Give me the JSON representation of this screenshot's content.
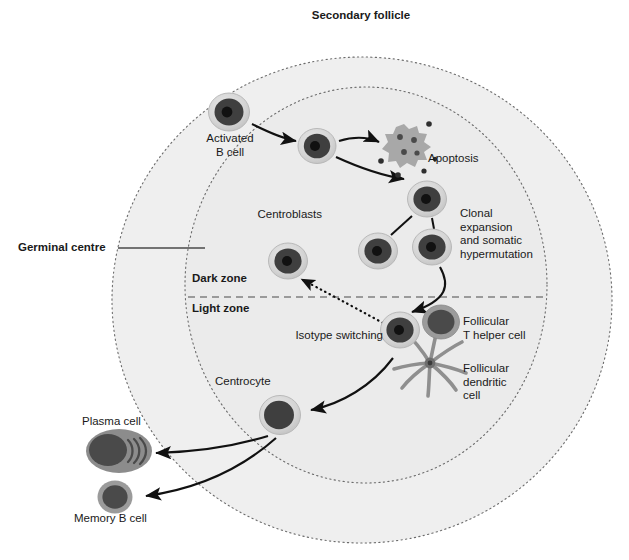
{
  "figure": {
    "title": "Secondary follicle",
    "background": "#ffffff"
  },
  "colors": {
    "follicle_fill": "#efefef",
    "germinal_centre_fill": "#ebebeb",
    "dotted_outline": "#6b6b6b",
    "cell_rim": "#d2d2d2",
    "cell_rim_stroke": "#b4b4b4",
    "cell_cytoplasm": "#4a4a4a",
    "cell_nucleus": "#111111",
    "t_cell_body": "#4a4a4a",
    "t_cell_rim": "#8a8a8a",
    "apoptosis_body": "#a8a8a8",
    "apoptosis_dots": "#4a4a4a",
    "dendritic_arms": "#8f8f8f",
    "plasma_cytoplasm": "#8c8c8c",
    "plasma_nucleus": "#4a4a4a",
    "arrow": "#111111",
    "text": "#1a1a1a"
  },
  "zones": {
    "outer_label": "Germinal centre",
    "dark_zone": "Dark zone",
    "light_zone": "Light zone"
  },
  "labels": {
    "activated_b_cell": "Activated\nB cell",
    "apoptosis": "Apoptosis",
    "centroblasts": "Centroblasts",
    "clonal_expansion": "Clonal\nexpansion\nand somatic\nhypermutation",
    "isotype_switching": "Isotype switching",
    "follicular_t_helper": "Follicular\nT helper cell",
    "follicular_dendritic": "Follicular\ndendritic\ncell",
    "centrocyte": "Centrocyte",
    "plasma_cell": "Plasma cell",
    "memory_b_cell": "Memory B cell"
  },
  "cells": [
    {
      "name": "activated-b-cell",
      "type": "b-cell",
      "cx": 229,
      "cy": 112,
      "r": 20
    },
    {
      "name": "migrating-b-cell",
      "type": "b-cell",
      "cx": 317,
      "cy": 146,
      "r": 18
    },
    {
      "name": "centroblast-parent",
      "type": "b-cell",
      "cx": 427,
      "cy": 199,
      "r": 19
    },
    {
      "name": "centroblast-left",
      "type": "b-cell",
      "cx": 378,
      "cy": 251,
      "r": 19
    },
    {
      "name": "centroblast-right",
      "type": "b-cell",
      "cx": 432,
      "cy": 247,
      "r": 19
    },
    {
      "name": "recycled-centroblast",
      "type": "b-cell",
      "cx": 288,
      "cy": 261,
      "r": 19
    },
    {
      "name": "isotype-switching-cell",
      "type": "b-cell",
      "cx": 400,
      "cy": 330,
      "r": 19
    },
    {
      "name": "follicular-t-helper-cell",
      "type": "t-cell",
      "cx": 441,
      "cy": 322,
      "r": 18
    },
    {
      "name": "centrocyte",
      "type": "centrocyte",
      "cx": 280,
      "cy": 415,
      "r": 20
    },
    {
      "name": "apoptotic-cell",
      "type": "apoptosis",
      "cx": 407,
      "cy": 146,
      "r": 19
    },
    {
      "name": "follicular-dendritic-cell",
      "type": "dendritic",
      "cx": 430,
      "cy": 363,
      "r": 28
    },
    {
      "name": "plasma-cell",
      "type": "plasma",
      "cx": 119,
      "cy": 451,
      "r": 26
    },
    {
      "name": "memory-b-cell",
      "type": "memory",
      "cx": 115,
      "cy": 497,
      "r": 17
    }
  ],
  "geometry": {
    "follicle": {
      "cx": 362,
      "cy": 300,
      "rx": 250,
      "ry": 243
    },
    "germinal_centre": {
      "cx": 366,
      "cy": 285,
      "rx": 181,
      "ry": 198
    },
    "zone_divider_y": 297
  },
  "flows": [
    {
      "from": "activated-b-cell",
      "to": "migrating-b-cell",
      "style": "solid"
    },
    {
      "from": "migrating-b-cell",
      "to": "apoptotic-cell",
      "style": "solid"
    },
    {
      "from": "migrating-b-cell",
      "to": "centroblast-parent",
      "style": "solid"
    },
    {
      "from": "centroblast-parent",
      "to": "centroblast-left",
      "style": "line"
    },
    {
      "from": "centroblast-parent",
      "to": "centroblast-right",
      "style": "line"
    },
    {
      "from": "centroblast-right",
      "to": "isotype-switching-cell",
      "style": "solid"
    },
    {
      "from": "isotype-switching-cell",
      "to": "recycled-centroblast",
      "style": "dotted"
    },
    {
      "from": "follicular-dendritic-cell",
      "to": "centrocyte",
      "style": "solid"
    },
    {
      "from": "centrocyte",
      "to": "plasma-cell",
      "style": "solid"
    },
    {
      "from": "centrocyte",
      "to": "memory-b-cell",
      "style": "solid"
    }
  ]
}
